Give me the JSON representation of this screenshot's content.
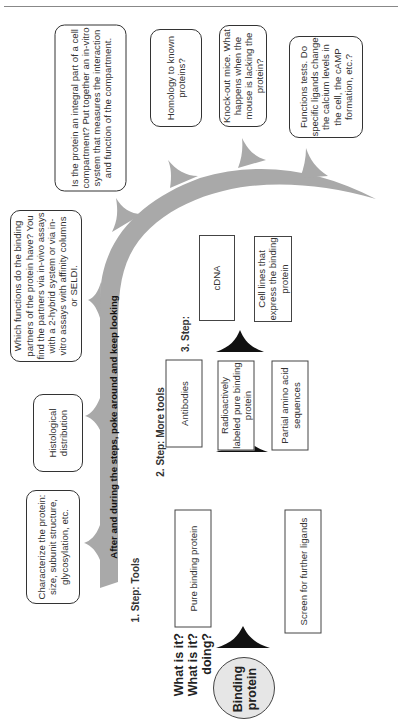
{
  "diagram": {
    "band_label": "After and during the steps, poke around and keep looking",
    "center": {
      "line1": "Binding",
      "line2": "protein"
    },
    "side_questions": [
      "What is it?",
      "What is it?",
      "doing?"
    ],
    "questions": [
      {
        "id": "characterize",
        "text": "Characterize the protein: size, subunit structure, glycosylation, etc."
      },
      {
        "id": "histological",
        "text": "Histological distribution"
      },
      {
        "id": "binding-partners",
        "text": "Which functions do the binding partners of the protein have? You find the partners via in-vivo assays with a 2-hybrid system or via in-vitro assays with affinity columns or SELDI."
      },
      {
        "id": "compartment",
        "text": "Is the protein an integral part of a cell compartment? Put together an in-vitro system that measures the interaction and function of the compartment."
      },
      {
        "id": "homology",
        "text": "Homology to known proteins?"
      },
      {
        "id": "knockout",
        "text": "Knock-out mice. What happens when the mouse is lacking the protein?"
      },
      {
        "id": "function-tests",
        "text": "Functions tests. Do specific ligands change the calcium levels in the cell, the cAMP formation, etc.?"
      }
    ],
    "steps": [
      {
        "label": "1. Step: Tools",
        "boxes": [
          "Pure binding protein",
          "Screen for further ligands"
        ]
      },
      {
        "label": "2. Step: More tools",
        "boxes": [
          "Antibodies",
          "Radioactively labeled pure binding protein",
          "Partial amino acid sequences"
        ]
      },
      {
        "label": "3. Step:",
        "boxes": [
          "cDNA",
          "Cell lines that express the binding protein"
        ]
      }
    ],
    "colors": {
      "band": "#a9a9a9",
      "circle_fill": "#e6e6e6",
      "arrow": "#111111",
      "border": "#333333"
    }
  }
}
